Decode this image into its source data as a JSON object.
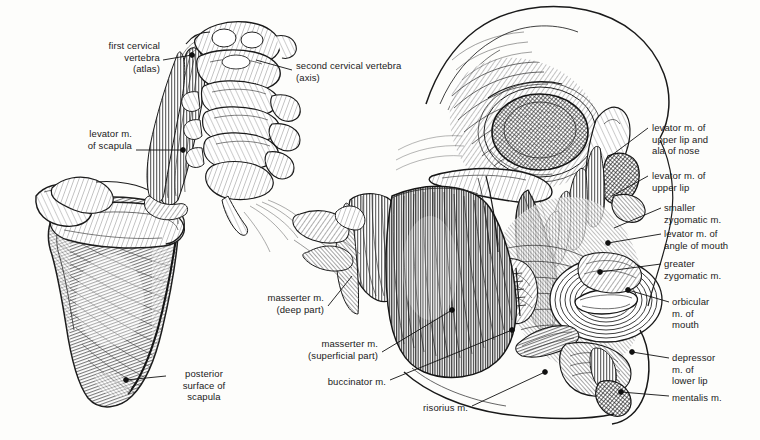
{
  "plate": {
    "title": "Muscles of the head and neck with scapula",
    "background_color": "#fdfdfb",
    "ink_color": "#1a1a1a",
    "width": 760,
    "height": 440,
    "style": "engraving-hatched-line-art"
  },
  "labels": [
    {
      "id": "first-cervical-vertebra",
      "lines": [
        "first cervical",
        "vertebra",
        "(atlas)"
      ],
      "align": "right",
      "x": 72,
      "y": 40,
      "w": 88,
      "leader": {
        "x1": 163,
        "y1": 60,
        "x2": 192,
        "y2": 55,
        "dot": true
      }
    },
    {
      "id": "second-cervical-vertebra",
      "lines": [
        "second cervical vertebra",
        "(axis)"
      ],
      "align": "left",
      "x": 296,
      "y": 60,
      "w": 130,
      "leader": {
        "x1": 292,
        "y1": 70,
        "x2": 256,
        "y2": 60,
        "dot": false
      }
    },
    {
      "id": "levator-m-of-scapula",
      "lines": [
        "levator m.",
        "of scapula"
      ],
      "align": "right",
      "x": 60,
      "y": 128,
      "w": 72,
      "leader": {
        "x1": 136,
        "y1": 150,
        "x2": 183,
        "y2": 150,
        "dot": true
      }
    },
    {
      "id": "posterior-surface-of-scapula",
      "lines": [
        "posterior",
        "surface of",
        "scapula"
      ],
      "align": "center",
      "x": 168,
      "y": 368,
      "w": 72,
      "leader": {
        "x1": 166,
        "y1": 376,
        "x2": 126,
        "y2": 380,
        "dot": true
      }
    },
    {
      "id": "masserter-m-deep-part",
      "lines": [
        "masserter m.",
        "(deep part)"
      ],
      "align": "right",
      "x": 248,
      "y": 292,
      "w": 76,
      "leader": {
        "x1": 328,
        "y1": 306,
        "x2": 352,
        "y2": 276,
        "dot": false
      }
    },
    {
      "id": "masserter-m-superficial-part",
      "lines": [
        "masserter m.",
        "(superficial part)"
      ],
      "align": "right",
      "x": 282,
      "y": 338,
      "w": 96,
      "leader": {
        "x1": 382,
        "y1": 352,
        "x2": 452,
        "y2": 310,
        "dot": true
      }
    },
    {
      "id": "buccinator-m",
      "lines": [
        "buccinator m."
      ],
      "align": "right",
      "x": 318,
      "y": 376,
      "w": 68,
      "leader": {
        "x1": 390,
        "y1": 380,
        "x2": 512,
        "y2": 330,
        "dot": true
      }
    },
    {
      "id": "risorius-m",
      "lines": [
        "risorius m."
      ],
      "align": "right",
      "x": 410,
      "y": 402,
      "w": 58,
      "leader": {
        "x1": 472,
        "y1": 406,
        "x2": 545,
        "y2": 372,
        "dot": true
      }
    },
    {
      "id": "levator-m-upper-lip-ala-nose",
      "lines": [
        "levator m. of",
        "upper lip and",
        "ala of nose"
      ],
      "align": "left",
      "x": 652,
      "y": 122,
      "w": 96,
      "leader": {
        "x1": 648,
        "y1": 128,
        "x2": 608,
        "y2": 158,
        "dot": false
      }
    },
    {
      "id": "levator-m-of-upper-lip",
      "lines": [
        "levator m. of",
        "upper lip"
      ],
      "align": "left",
      "x": 652,
      "y": 170,
      "w": 96,
      "leader": {
        "x1": 648,
        "y1": 176,
        "x2": 612,
        "y2": 196,
        "dot": false
      }
    },
    {
      "id": "smaller-zygomatic-m",
      "lines": [
        "smaller",
        "zygomatic m."
      ],
      "align": "left",
      "x": 664,
      "y": 202,
      "w": 86,
      "leader": {
        "x1": 661,
        "y1": 208,
        "x2": 614,
        "y2": 228,
        "dot": false
      }
    },
    {
      "id": "levator-m-of-angle-of-mouth",
      "lines": [
        "levator m. of",
        "angle of mouth"
      ],
      "align": "left",
      "x": 664,
      "y": 228,
      "w": 96,
      "leader": {
        "x1": 661,
        "y1": 234,
        "x2": 608,
        "y2": 243,
        "dot": true
      }
    },
    {
      "id": "greater-zygomatic-m",
      "lines": [
        "greater",
        "zygomatic m."
      ],
      "align": "left",
      "x": 664,
      "y": 258,
      "w": 86,
      "leader": {
        "x1": 661,
        "y1": 264,
        "x2": 600,
        "y2": 272,
        "dot": true
      }
    },
    {
      "id": "orbicular-m-of-mouth",
      "lines": [
        "orbicular",
        "m. of",
        "mouth"
      ],
      "align": "left",
      "x": 672,
      "y": 296,
      "w": 62,
      "leader": {
        "x1": 669,
        "y1": 302,
        "x2": 628,
        "y2": 290,
        "dot": true
      }
    },
    {
      "id": "depressor-m-of-lower-lip",
      "lines": [
        "depressor",
        "m. of",
        "lower lip"
      ],
      "align": "left",
      "x": 672,
      "y": 352,
      "w": 62,
      "leader": {
        "x1": 669,
        "y1": 358,
        "x2": 632,
        "y2": 352,
        "dot": true
      }
    },
    {
      "id": "mentalis-m",
      "lines": [
        "mentalis m."
      ],
      "align": "left",
      "x": 672,
      "y": 392,
      "w": 62,
      "leader": {
        "x1": 669,
        "y1": 396,
        "x2": 621,
        "y2": 392,
        "dot": true
      }
    }
  ]
}
